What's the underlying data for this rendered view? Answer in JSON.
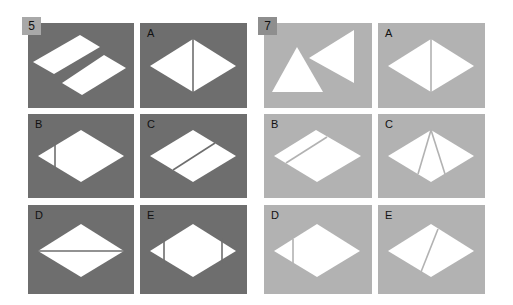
{
  "colors": {
    "background": "#ffffff",
    "set5_panel": "#6e6e6e",
    "set5_badge": "#a8a8a8",
    "set7_panel": "#b2b2b2",
    "set7_badge": "#8e8e8e",
    "shape": "#ffffff"
  },
  "puzzles": [
    {
      "number": "5",
      "question": {
        "description": "two parallelogram strips separated by a diagonal gap"
      },
      "options": [
        {
          "label": "A",
          "description": "rhombus split by vertical line through center"
        },
        {
          "label": "B",
          "description": "rhombus with vertical cut near left tip"
        },
        {
          "label": "C",
          "description": "rhombus split by diagonal line parallel to edge"
        },
        {
          "label": "D",
          "description": "rhombus split by horizontal line"
        },
        {
          "label": "E",
          "description": "rhombus with vertical cuts near both tips"
        }
      ]
    },
    {
      "number": "7",
      "question": {
        "description": "upright triangle and left-pointing triangle"
      },
      "options": [
        {
          "label": "A",
          "description": "rhombus split by vertical line through center"
        },
        {
          "label": "B",
          "description": "rhombus split by diagonal line near top-left edge"
        },
        {
          "label": "C",
          "description": "rhombus with two lines from top vertex to bottom edges"
        },
        {
          "label": "D",
          "description": "rhombus with vertical cut near left tip"
        },
        {
          "label": "E",
          "description": "rhombus split by slanted line from top to bottom"
        }
      ]
    }
  ]
}
